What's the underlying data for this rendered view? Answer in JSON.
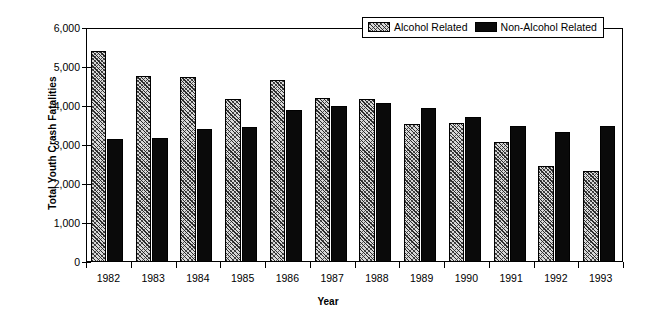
{
  "chart_data": {
    "type": "bar",
    "title": "",
    "xlabel": "Year",
    "ylabel": "Total Youth Crash Fatalities",
    "categories": [
      "1982",
      "1983",
      "1984",
      "1985",
      "1986",
      "1987",
      "1988",
      "1989",
      "1990",
      "1991",
      "1992",
      "1993"
    ],
    "series": [
      {
        "name": "Alcohol Related",
        "values": [
          5400,
          4780,
          4740,
          4190,
          4660,
          4210,
          4170,
          3540,
          3570,
          3090,
          2450,
          2330
        ]
      },
      {
        "name": "Non-Alcohol Related",
        "values": [
          3150,
          3180,
          3410,
          3470,
          3900,
          3990,
          4090,
          3940,
          3720,
          3500,
          3330,
          3500
        ]
      }
    ],
    "ylim": [
      0,
      6000
    ],
    "ytick_values": [
      0,
      1000,
      2000,
      3000,
      4000,
      5000,
      6000
    ],
    "ytick_labels": [
      "0",
      "1,000",
      "2,000",
      "3,000",
      "4,000",
      "5,000",
      "6,000"
    ],
    "grid": false,
    "legend_position": "top-right",
    "colors": {
      "alcohol_related": "#d8d8d8",
      "non_alcohol_related": "#0a0a0a",
      "axis": "#000000",
      "background": "#ffffff"
    }
  },
  "legend": {
    "items": [
      {
        "label": "Alcohol Related",
        "swatch": "hatched-swatch"
      },
      {
        "label": "Non-Alcohol Related",
        "swatch": "solid-black-swatch"
      }
    ]
  }
}
